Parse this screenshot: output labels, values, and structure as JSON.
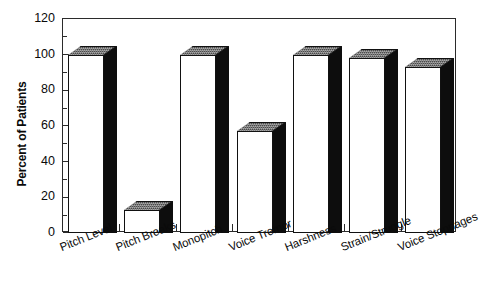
{
  "chart_data": {
    "type": "bar",
    "title": "",
    "xlabel": "",
    "ylabel": "Percent of Patients",
    "ylim": [
      0,
      120
    ],
    "ytick_step": 20,
    "yminor_step": 10,
    "grid": false,
    "legend": null,
    "categories": [
      "Pitch Level",
      "Pitch Breaks",
      "Monopitch",
      "Voice Tremor",
      "Harshness",
      "Strain/Struggle",
      "Voice Stoppages"
    ],
    "values": [
      100,
      13,
      100,
      57,
      100,
      98,
      93
    ],
    "ytick_labels": [
      "0",
      "20",
      "40",
      "60",
      "80",
      "100",
      "120"
    ],
    "ytick_values": [
      0,
      20,
      40,
      60,
      80,
      100,
      120
    ],
    "style": {
      "bar_face_color": "#ffffff",
      "bar_side_color": "#0d0d0d",
      "bar_top_color": "#4a4a4a",
      "bar_edge_color": "#111111",
      "axis_color": "#2b2b2b",
      "background_color": "#ffffff",
      "text_color": "#0a0a0a"
    }
  }
}
